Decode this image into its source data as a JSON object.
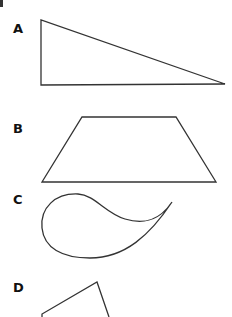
{
  "figures": [
    {
      "label": "A",
      "shape": "right-triangle"
    },
    {
      "label": "B",
      "shape": "trapezoid"
    },
    {
      "label": "C",
      "shape": "teardrop-curve"
    },
    {
      "label": "D",
      "shape": "partial-quadrilateral"
    }
  ],
  "colors": {
    "stroke": "#333333",
    "background": "#ffffff",
    "label": "#111111"
  }
}
